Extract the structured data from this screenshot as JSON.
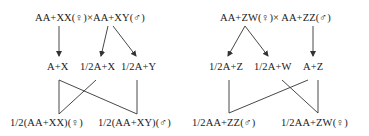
{
  "left_diagram": {
    "parents": "AA+XX(♀)×AA+XY(♂)",
    "gametes": [
      "A+X",
      "1/2A+X",
      "1/2A+Y"
    ],
    "offspring": [
      "1/2(AA+XX)(♀)",
      "1/2(AA+XY)(♂)"
    ]
  },
  "right_diagram": {
    "parents": "AA+ZW(♀)× AA+ZZ(♂)",
    "gametes": [
      "1/2A+Z",
      "1/2A+W",
      "A+Z"
    ],
    "offspring": [
      "1/2AA+ZZ(♂)",
      "1/2AA+ZW(♀)"
    ]
  },
  "colors": {
    "ink": "#1a1a1a",
    "line": "#333333",
    "background": "#ffffff"
  }
}
